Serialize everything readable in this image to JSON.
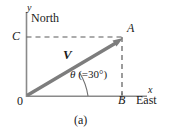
{
  "figure": {
    "caption": "(a)",
    "type": "vector-diagram",
    "background_color": "#ffffff",
    "axes": {
      "y_label": "y",
      "x_label": "x",
      "origin_label": "0",
      "axis_color": "#8a8a8a"
    },
    "compass": {
      "north_label": "North",
      "east_label": "East"
    },
    "points": {
      "a_label": "A",
      "b_label": "B",
      "c_label": "C"
    },
    "vector": {
      "label": "V",
      "color": "#7d7d7d",
      "origin": "0",
      "tip": "A"
    },
    "angle": {
      "symbol": "θ",
      "value_text": " (=30°)",
      "degrees": 30
    },
    "guides": {
      "horizontal_dashed": "C to A",
      "vertical_dashed": "B to A",
      "dash_color": "#5a5a5a"
    }
  }
}
